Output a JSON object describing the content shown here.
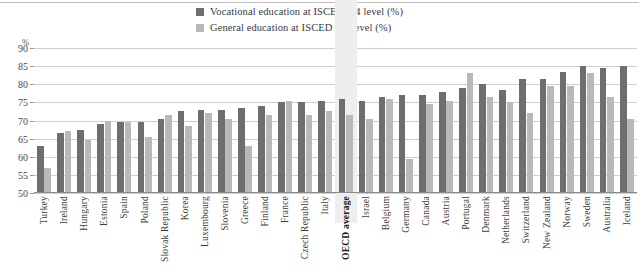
{
  "chart_data": {
    "type": "bar",
    "title": "",
    "subtitle": "",
    "xlabel": "",
    "ylabel": "%",
    "ylim": [
      50,
      90
    ],
    "ytick_step": 5,
    "yticks": [
      50,
      55,
      60,
      65,
      70,
      75,
      80,
      85,
      90
    ],
    "grid": true,
    "legend_position": "top-center",
    "highlight_category": "OECD average",
    "colors": {
      "vocational": "#6e6e6e",
      "general": "#b9b9b9",
      "gridline": "#cfcfcf",
      "highlight_band": "#eeeeee"
    },
    "categories": [
      "Turkey",
      "Ireland",
      "Hungary",
      "Estonia",
      "Spain",
      "Poland",
      "Slovak Republic",
      "Korea",
      "Luxembourg",
      "Slovenia",
      "Greece",
      "Finland",
      "France",
      "Czech Republic",
      "Italy",
      "OECD average",
      "Israel",
      "Belgium",
      "Germany",
      "Canada",
      "Austria",
      "Portugal",
      "Denmark",
      "Netherlands",
      "Switzerland",
      "New Zealand",
      "Norway",
      "Sweden",
      "Australia",
      "Iceland"
    ],
    "series": [
      {
        "name": "Vocational education at ISCED 3/4 level (%)",
        "key": "vocational",
        "values": [
          63.0,
          66.5,
          67.5,
          69.0,
          69.5,
          69.5,
          70.5,
          72.5,
          73.0,
          73.0,
          73.5,
          74.0,
          75.0,
          75.0,
          75.5,
          76.0,
          75.5,
          76.5,
          77.0,
          77.0,
          78.0,
          79.0,
          80.0,
          78.5,
          81.5,
          81.5,
          83.5,
          85.0,
          84.5,
          85.0
        ]
      },
      {
        "name": "General education at ISCED 3/4 level (%)",
        "key": "general",
        "values": [
          57.0,
          67.0,
          64.5,
          70.0,
          69.5,
          65.5,
          71.5,
          68.5,
          72.0,
          70.5,
          63.0,
          71.5,
          75.5,
          71.5,
          72.5,
          71.5,
          70.5,
          76.0,
          59.5,
          74.5,
          75.5,
          83.0,
          76.5,
          75.0,
          72.0,
          79.5,
          79.5,
          83.0,
          76.5,
          70.5
        ]
      }
    ]
  },
  "legend": {
    "items": [
      {
        "label": "Vocational education at ISCED 3/4 level (%)",
        "key": "vocational"
      },
      {
        "label": "General education at ISCED 3/4 level (%)",
        "key": "general"
      }
    ]
  },
  "axis": {
    "unit_label": "%"
  }
}
